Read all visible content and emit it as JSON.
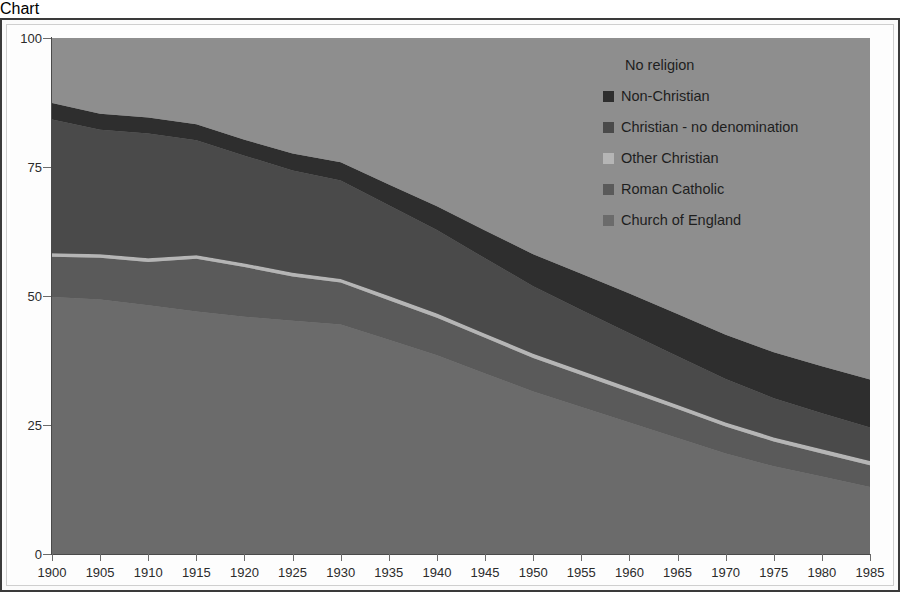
{
  "chart_data": {
    "type": "area",
    "stacked": true,
    "normalized_percent": true,
    "title": "",
    "subtitle": "",
    "xlabel": "",
    "ylabel": "",
    "xlim": [
      1900,
      1985
    ],
    "ylim": [
      0,
      100
    ],
    "yticks": [
      0,
      25,
      50,
      75,
      100
    ],
    "ytick_labels": [
      "0",
      "25",
      "50",
      "75",
      "100"
    ],
    "x": [
      1900,
      1905,
      1910,
      1915,
      1920,
      1925,
      1930,
      1935,
      1940,
      1945,
      1950,
      1955,
      1960,
      1965,
      1970,
      1975,
      1980,
      1985
    ],
    "xtick_labels": [
      "1900",
      "1905",
      "1910",
      "1915",
      "1920",
      "1925",
      "1930",
      "1935",
      "1940",
      "1945",
      "1950",
      "1955",
      "1960",
      "1965",
      "1970",
      "1975",
      "1980",
      "1985"
    ],
    "grid": false,
    "legend_position": "inside-top-right",
    "stack_order_bottom_to_top": [
      "Church of England",
      "Roman Catholic",
      "Other Christian",
      "Christian - no denomination",
      "Non-Christian",
      "No religion"
    ],
    "series": [
      {
        "name": "Church of England",
        "color": "#6b6b6b",
        "values": [
          49.8,
          49.3,
          48.2,
          47.0,
          46.0,
          45.2,
          44.5,
          41.5,
          38.5,
          35.0,
          31.5,
          28.5,
          25.5,
          22.5,
          19.5,
          17.0,
          15.0,
          13.0
        ]
      },
      {
        "name": "Roman Catholic",
        "color": "#5a5a5a",
        "values": [
          7.8,
          8.1,
          8.4,
          10.2,
          9.6,
          8.6,
          8.1,
          7.7,
          7.3,
          6.9,
          6.5,
          6.2,
          5.9,
          5.6,
          5.2,
          4.8,
          4.5,
          4.2
        ]
      },
      {
        "name": "Other Christian",
        "color": "#b5b5b5",
        "values": [
          0.7,
          0.7,
          0.7,
          0.7,
          0.7,
          0.7,
          0.7,
          0.8,
          0.8,
          0.8,
          0.8,
          0.8,
          0.8,
          0.8,
          0.8,
          0.8,
          0.8,
          0.8
        ]
      },
      {
        "name": "Christian - no denomination",
        "color": "#4a4a4a",
        "values": [
          25.9,
          24.1,
          24.2,
          22.3,
          20.9,
          19.8,
          19.1,
          17.6,
          16.2,
          14.6,
          13.1,
          11.8,
          10.6,
          9.4,
          8.4,
          7.6,
          7.0,
          6.5
        ]
      },
      {
        "name": "Non-Christian",
        "color": "#2e2e2e",
        "values": [
          3.2,
          3.1,
          3.1,
          3.1,
          3.1,
          3.3,
          3.5,
          4.0,
          4.6,
          5.4,
          6.2,
          7.0,
          7.7,
          8.2,
          8.6,
          8.9,
          9.1,
          9.3
        ]
      },
      {
        "name": "No religion",
        "color": "#8e8e8e",
        "values": [
          12.6,
          14.7,
          15.4,
          16.7,
          19.7,
          22.4,
          24.1,
          28.4,
          32.6,
          37.3,
          41.9,
          45.7,
          49.5,
          53.5,
          57.5,
          60.9,
          63.6,
          66.2
        ]
      }
    ],
    "cumulative_top_boundaries": {
      "church_of_england": [
        49.8,
        49.3,
        48.2,
        47.0,
        46.0,
        45.2,
        44.5,
        41.5,
        38.5,
        35.0,
        31.5,
        28.5,
        25.5,
        22.5,
        19.5,
        17.0,
        15.0,
        13.0
      ],
      "roman_catholic": [
        57.6,
        57.4,
        56.6,
        57.2,
        55.6,
        53.8,
        52.6,
        49.2,
        45.8,
        41.9,
        38.0,
        34.7,
        31.4,
        28.1,
        24.7,
        21.8,
        19.5,
        17.2
      ],
      "other_christian": [
        58.3,
        58.1,
        57.3,
        57.9,
        56.3,
        54.5,
        53.3,
        50.0,
        46.6,
        42.7,
        38.8,
        35.5,
        32.2,
        28.9,
        25.5,
        22.6,
        20.3,
        18.0
      ],
      "christian_no_denomination": [
        84.2,
        82.2,
        81.5,
        80.2,
        77.2,
        74.3,
        72.4,
        67.6,
        62.8,
        57.3,
        51.9,
        47.3,
        42.8,
        38.3,
        33.9,
        30.2,
        27.3,
        24.5
      ],
      "non_christian": [
        87.4,
        85.3,
        84.6,
        83.3,
        80.3,
        77.6,
        75.9,
        71.6,
        67.4,
        62.7,
        58.1,
        54.3,
        50.5,
        46.5,
        42.5,
        39.1,
        36.4,
        33.8
      ],
      "no_religion": [
        100,
        100,
        100,
        100,
        100,
        100,
        100,
        100,
        100,
        100,
        100,
        100,
        100,
        100,
        100,
        100,
        100,
        100
      ]
    }
  },
  "legend": {
    "items": [
      {
        "label": "No religion",
        "color": "#8e8e8e",
        "swatch": false
      },
      {
        "label": "Non-Christian",
        "color": "#2e2e2e",
        "swatch": true
      },
      {
        "label": "Christian - no denomination",
        "color": "#4a4a4a",
        "swatch": true
      },
      {
        "label": "Other Christian",
        "color": "#b5b5b5",
        "swatch": true
      },
      {
        "label": "Roman Catholic",
        "color": "#5a5a5a",
        "swatch": true
      },
      {
        "label": "Church of England",
        "color": "#6b6b6b",
        "swatch": true
      }
    ]
  },
  "axes": {
    "y_tick_labels": [
      "100",
      "75",
      "50",
      "25",
      "0"
    ],
    "x_tick_labels": [
      "1900",
      "1905",
      "1910",
      "1915",
      "1920",
      "1925",
      "1930",
      "1935",
      "1940",
      "1945",
      "1950",
      "1955",
      "1960",
      "1965",
      "1970",
      "1975",
      "1980",
      "1985"
    ]
  },
  "colors": {
    "plot_background": "#8e8e8e",
    "figure_background": "#fdfdfd",
    "axis": "#4a4a4a",
    "text": "#2b2b2b",
    "border": "#3a3a3a"
  }
}
